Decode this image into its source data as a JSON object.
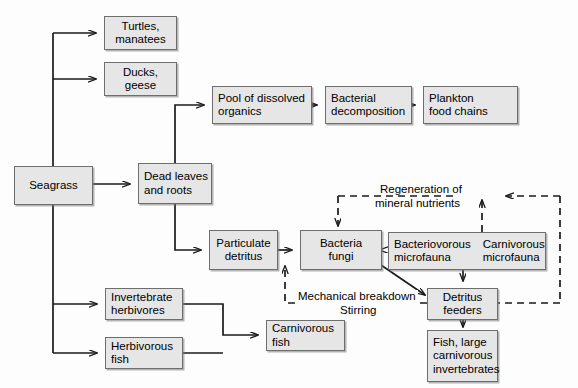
{
  "diagram": {
    "type": "flowchart",
    "colors": {
      "node_fill": "#e6e6e6",
      "node_border": "#6e6e6e",
      "edge_solid": "#1a1a1a",
      "edge_dashed": "#1a1a1a",
      "background": "#fdfdfd",
      "text": "#000000"
    },
    "nodes": [
      {
        "id": "seagrass",
        "lines": [
          "Seagrass"
        ],
        "align": "center"
      },
      {
        "id": "turtles",
        "lines": [
          "Turtles,",
          "manatees"
        ],
        "align": "center"
      },
      {
        "id": "ducks",
        "lines": [
          "Ducks,",
          "geese"
        ],
        "align": "center"
      },
      {
        "id": "dead_leaves",
        "lines": [
          "Dead leaves",
          "and roots"
        ],
        "align": "left"
      },
      {
        "id": "pool_organics",
        "lines": [
          "Pool of dissolved",
          "organics"
        ],
        "align": "left"
      },
      {
        "id": "bacterial_decomp",
        "lines": [
          "Bacterial",
          "decomposition"
        ],
        "align": "left"
      },
      {
        "id": "plankton",
        "lines": [
          "Plankton",
          "food chains"
        ],
        "align": "left"
      },
      {
        "id": "particulate",
        "lines": [
          "Particulate",
          "detritus"
        ],
        "align": "center"
      },
      {
        "id": "bacteria_fungi",
        "lines": [
          "Bacteria",
          "fungi"
        ],
        "align": "center"
      },
      {
        "id": "microfauna_1",
        "lines": [
          "Bacteriovorous",
          "microfauna"
        ],
        "align": "left"
      },
      {
        "id": "microfauna_2",
        "lines": [
          "Carnivorous",
          "microfauna"
        ],
        "align": "left"
      },
      {
        "id": "detritus_feeders",
        "lines": [
          "Detritus",
          "feeders"
        ],
        "align": "center"
      },
      {
        "id": "fish_large",
        "lines": [
          "Fish, large",
          "carnivorous",
          "invertebrates"
        ],
        "align": "left"
      },
      {
        "id": "invert_herb",
        "lines": [
          "Invertebrate",
          "herbivores"
        ],
        "align": "left"
      },
      {
        "id": "herb_fish",
        "lines": [
          "Herbivorous",
          "fish"
        ],
        "align": "left"
      },
      {
        "id": "carniv_fish",
        "lines": [
          "Carnivorous",
          "fish"
        ],
        "align": "left"
      }
    ],
    "edge_labels": {
      "regeneration_1": "Regeneration of",
      "regeneration_2": "mineral nutrients",
      "mechanical": "Mechanical breakdown",
      "stirring": "Stirring"
    },
    "edges": [
      {
        "from": "seagrass",
        "to": "turtles",
        "style": "solid"
      },
      {
        "from": "seagrass",
        "to": "ducks",
        "style": "solid"
      },
      {
        "from": "seagrass",
        "to": "dead_leaves",
        "style": "solid"
      },
      {
        "from": "seagrass",
        "to": "invert_herb",
        "style": "solid"
      },
      {
        "from": "seagrass",
        "to": "herb_fish",
        "style": "solid"
      },
      {
        "from": "dead_leaves",
        "to": "pool_organics",
        "style": "solid"
      },
      {
        "from": "dead_leaves",
        "to": "particulate",
        "style": "solid"
      },
      {
        "from": "pool_organics",
        "to": "bacterial_decomp",
        "style": "solid"
      },
      {
        "from": "bacterial_decomp",
        "to": "plankton",
        "style": "solid"
      },
      {
        "from": "particulate",
        "to": "bacteria_fungi",
        "style": "solid"
      },
      {
        "from": "bacteria_fungi",
        "to": "microfauna_1",
        "style": "solid"
      },
      {
        "from": "bacteria_fungi",
        "to": "detritus_feeders",
        "style": "solid"
      },
      {
        "from": "microfauna_1",
        "to": "detritus_feeders",
        "style": "solid"
      },
      {
        "from": "detritus_feeders",
        "to": "fish_large",
        "style": "solid"
      },
      {
        "from": "invert_herb",
        "to": "carniv_fish",
        "style": "solid"
      },
      {
        "from": "herb_fish",
        "to": "carniv_fish",
        "style": "solid"
      },
      {
        "from": "regeneration",
        "to": "bacteria_fungi",
        "style": "dashed",
        "label": "Regeneration of mineral nutrients"
      },
      {
        "from": "microfauna",
        "to": "regeneration",
        "style": "dashed",
        "label": "Regeneration of mineral nutrients"
      },
      {
        "from": "detritus_feeders",
        "to": "particulate",
        "style": "dashed",
        "label": "Mechanical breakdown Stirring"
      },
      {
        "from": "detritus_feeders",
        "to": "regeneration",
        "style": "dashed"
      }
    ]
  }
}
